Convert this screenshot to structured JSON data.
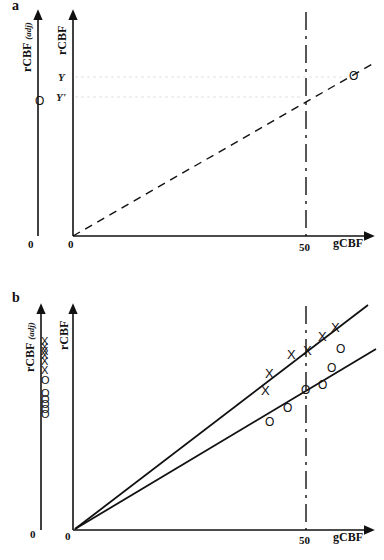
{
  "panel_a": {
    "label": "a",
    "left_axis_label": "rCBF",
    "left_axis_sub": "(adj)",
    "y_axis_label": "rCBF",
    "x_axis_label": "gCBF",
    "left_origin": "0",
    "origin": "0",
    "x_tick": "50",
    "y_levels": [
      "Y",
      "Y'"
    ],
    "marker": "O"
  },
  "panel_b": {
    "label": "b",
    "left_axis_label": "rCBF",
    "left_axis_sub": "(adj)",
    "y_axis_label": "rCBF",
    "x_axis_label": "gCBF",
    "left_origin": "0",
    "origin": "0",
    "x_tick": "50",
    "marker_x": "X",
    "marker_o": "O"
  },
  "colors": {
    "ink": "#111111",
    "guide": "#dddddd"
  }
}
